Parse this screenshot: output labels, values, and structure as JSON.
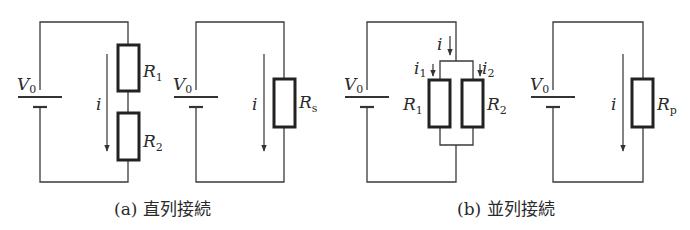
{
  "figure": {
    "colors": {
      "line": "#333333",
      "background": "#ffffff"
    },
    "subfigures": [
      {
        "id": "a",
        "caption": "(a) 直列接続",
        "circuits": [
          {
            "name": "series-circuit",
            "source": {
              "label": "V",
              "subscript": "0"
            },
            "current": {
              "label": "i"
            },
            "resistors": [
              {
                "label": "R",
                "subscript": "1"
              },
              {
                "label": "R",
                "subscript": "2"
              }
            ]
          },
          {
            "name": "series-equivalent",
            "source": {
              "label": "V",
              "subscript": "0"
            },
            "current": {
              "label": "i"
            },
            "resistors": [
              {
                "label": "R",
                "subscript": "s"
              }
            ]
          }
        ]
      },
      {
        "id": "b",
        "caption": "(b) 並列接続",
        "circuits": [
          {
            "name": "parallel-circuit",
            "source": {
              "label": "V",
              "subscript": "0"
            },
            "current": {
              "label": "i"
            },
            "branch_currents": [
              {
                "label": "i",
                "subscript": "1"
              },
              {
                "label": "i",
                "subscript": "2"
              }
            ],
            "resistors": [
              {
                "label": "R",
                "subscript": "1"
              },
              {
                "label": "R",
                "subscript": "2"
              }
            ]
          },
          {
            "name": "parallel-equivalent",
            "source": {
              "label": "V",
              "subscript": "0"
            },
            "current": {
              "label": "i"
            },
            "resistors": [
              {
                "label": "R",
                "subscript": "p"
              }
            ]
          }
        ]
      }
    ]
  }
}
